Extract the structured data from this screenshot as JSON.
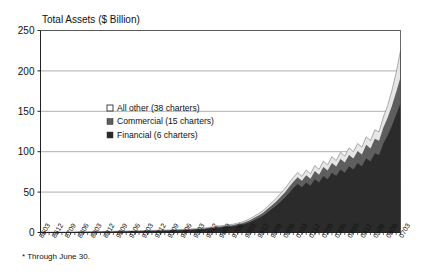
{
  "chart_data": {
    "type": "area",
    "title": "Total Assets ($ Billion)",
    "xlabel": "",
    "ylabel": "Total Assets ($ Billion)",
    "ylim": [
      0,
      250
    ],
    "yticks": [
      0,
      50,
      100,
      150,
      200,
      250
    ],
    "grid": true,
    "stacked": true,
    "legend_position": "inside-upper-left",
    "footnote": "* Through June 30.",
    "categories": [
      "8603",
      "8606",
      "8609",
      "8612",
      "8703",
      "8706",
      "8709",
      "8712",
      "8803",
      "8806",
      "8809",
      "8812",
      "8903",
      "8906",
      "8909",
      "8912",
      "9003",
      "9006",
      "9009",
      "9012",
      "9103",
      "9106",
      "9109",
      "9112",
      "9203",
      "9206",
      "9209",
      "9212",
      "9303",
      "9306",
      "9309",
      "9312",
      "9403",
      "9406",
      "9409",
      "9412",
      "9503",
      "9506",
      "9509",
      "9512",
      "9603",
      "9606",
      "9609",
      "9612",
      "9703",
      "9706",
      "9709",
      "9712",
      "9803",
      "9806",
      "9809",
      "9812",
      "9903",
      "9906",
      "9909",
      "9912",
      "0003",
      "0006",
      "0009",
      "0012",
      "0103",
      "0106",
      "0109",
      "0112",
      "0203",
      "0206",
      "0209",
      "0212",
      "0303",
      "0306",
      "0309",
      "0312",
      "0403",
      "0406",
      "0409",
      "0412",
      "0503",
      "0506",
      "0509",
      "0512",
      "0603",
      "0606",
      "0609",
      "0612",
      "0703"
    ],
    "tick_labels": [
      "8603",
      "8612",
      "8709",
      "8806",
      "8903",
      "8912",
      "9009",
      "9106",
      "9203",
      "9212",
      "9309",
      "9406",
      "9503",
      "9512",
      "9609",
      "9706",
      "9803",
      "9812",
      "9909",
      "0006",
      "0103",
      "0112",
      "0209",
      "0306",
      "0403",
      "0412",
      "0509",
      "0606",
      "0703"
    ],
    "tick_label_every": 3,
    "series": [
      {
        "name": "Financial (6 charters)",
        "color": "#2b2b2b",
        "values": [
          0.2,
          0.2,
          0.3,
          0.3,
          0.3,
          0.4,
          0.4,
          0.5,
          0.5,
          0.6,
          0.6,
          0.7,
          0.7,
          0.8,
          0.8,
          0.9,
          1.0,
          1.0,
          1.1,
          1.2,
          1.3,
          1.4,
          1.5,
          1.6,
          1.7,
          1.8,
          1.9,
          2.0,
          2.1,
          2.2,
          2.3,
          2.5,
          2.6,
          2.8,
          3.0,
          3.2,
          3.4,
          3.6,
          4.0,
          4.5,
          5.0,
          5.6,
          6.2,
          6.6,
          7.0,
          7.6,
          8.6,
          9.6,
          11.0,
          13.0,
          15.5,
          18.0,
          21.0,
          25.0,
          29.0,
          33.0,
          38.0,
          43.0,
          49.0,
          55.0,
          60.0,
          56.0,
          62.0,
          58.0,
          66.0,
          62.0,
          70.0,
          66.0,
          74.0,
          70.0,
          78.0,
          74.0,
          82.0,
          78.0,
          86.0,
          82.0,
          92.0,
          88.0,
          98.0,
          96.0,
          110.0,
          120.0,
          132.0,
          146.0,
          160.0
        ]
      },
      {
        "name": "Commercial (15 charters)",
        "color": "#5e5e5e",
        "values": [
          0.1,
          0.1,
          0.1,
          0.1,
          0.1,
          0.1,
          0.1,
          0.2,
          0.2,
          0.2,
          0.2,
          0.2,
          0.2,
          0.2,
          0.2,
          0.3,
          0.3,
          0.3,
          0.3,
          0.3,
          0.3,
          0.4,
          0.4,
          0.4,
          0.4,
          0.4,
          0.5,
          0.5,
          0.5,
          0.5,
          0.6,
          0.6,
          0.6,
          0.7,
          0.7,
          0.7,
          0.8,
          0.8,
          0.9,
          1.0,
          1.1,
          1.2,
          1.3,
          1.4,
          1.5,
          1.6,
          1.8,
          2.0,
          2.3,
          2.6,
          3.0,
          3.4,
          3.8,
          4.3,
          4.8,
          5.4,
          6.0,
          6.6,
          7.2,
          7.8,
          8.4,
          8.0,
          9.0,
          8.6,
          10.0,
          9.6,
          11.0,
          10.6,
          12.0,
          11.6,
          13.0,
          12.6,
          14.0,
          13.6,
          15.0,
          14.6,
          16.5,
          16.0,
          18.0,
          17.6,
          20.0,
          22.0,
          25.0,
          28.0,
          32.0
        ]
      },
      {
        "name": "All other (38 charters)",
        "color": "#e6e6e6",
        "values": [
          0.1,
          0.1,
          0.1,
          0.1,
          0.1,
          0.1,
          0.1,
          0.1,
          0.1,
          0.1,
          0.1,
          0.1,
          0.1,
          0.1,
          0.1,
          0.1,
          0.2,
          0.2,
          0.2,
          0.2,
          0.2,
          0.2,
          0.2,
          0.2,
          0.2,
          0.3,
          0.3,
          0.3,
          0.3,
          0.3,
          0.3,
          0.4,
          0.4,
          0.4,
          0.4,
          0.5,
          0.5,
          0.5,
          0.6,
          0.6,
          0.7,
          0.8,
          0.8,
          0.9,
          1.0,
          1.1,
          1.2,
          1.4,
          1.6,
          1.8,
          2.0,
          2.3,
          2.6,
          3.0,
          3.4,
          3.8,
          4.2,
          4.6,
          5.0,
          5.4,
          5.8,
          5.5,
          6.2,
          6.0,
          6.8,
          6.5,
          7.2,
          7.0,
          7.8,
          7.5,
          8.2,
          8.0,
          8.8,
          8.5,
          9.2,
          9.0,
          10.0,
          9.8,
          11.0,
          11.0,
          13.0,
          15.0,
          19.0,
          24.0,
          33.0
        ]
      }
    ]
  },
  "legend": {
    "items": [
      {
        "label": "All other (38 charters)",
        "marker": "open-square-marker",
        "color": "#ffffff"
      },
      {
        "label": "Commercial (15 charters)",
        "marker": "filled-square-marker",
        "color": "#5e5e5e"
      },
      {
        "label": "Financial (6 charters)",
        "marker": "filled-square-marker",
        "color": "#2b2b2b"
      }
    ]
  }
}
